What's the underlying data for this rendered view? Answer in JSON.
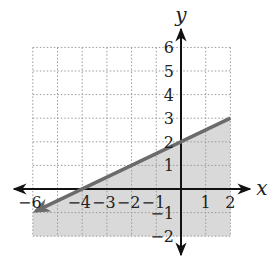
{
  "chart_data": {
    "type": "line",
    "title": "",
    "xlabel": "x",
    "ylabel": "y",
    "xlim": [
      -6,
      2
    ],
    "ylim": [
      -2,
      6
    ],
    "grid": true,
    "grid_style": "dotted",
    "x_ticks": [
      -6,
      -4,
      -3,
      -2,
      -1,
      1,
      2
    ],
    "y_ticks": [
      6,
      5,
      4,
      3,
      2,
      1,
      -1,
      -2
    ],
    "x_tick_labels": [
      "−6",
      "−4",
      "−3",
      "−2",
      "−1",
      "1",
      "2"
    ],
    "y_tick_labels": [
      "6",
      "5",
      "4",
      "3",
      "2",
      "1",
      "−1",
      "−2"
    ],
    "series": [
      {
        "name": "boundary line",
        "equation": "y = 0.5x + 2",
        "style": "solid",
        "x": [
          -6,
          -4,
          0,
          2
        ],
        "y": [
          -1,
          0,
          2,
          3
        ]
      }
    ],
    "shaded_region": "below line (y ≤ ½x + 2)",
    "colors": {
      "line": "#6b6b6b",
      "shade": "#d9d9d9",
      "axis": "#111111",
      "grid": "#9a9a9a"
    }
  }
}
